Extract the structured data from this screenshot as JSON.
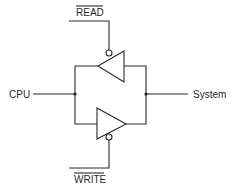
{
  "diagram": {
    "type": "bidirectional-buffer",
    "labels": {
      "read": "READ",
      "write": "WRITE",
      "cpu": "CPU",
      "system": "System"
    },
    "signals": {
      "read_active_low": true,
      "write_active_low": true
    },
    "buffers": [
      {
        "name": "read-buffer",
        "direction": "System to CPU",
        "enable": "READ"
      },
      {
        "name": "write-buffer",
        "direction": "CPU to System",
        "enable": "WRITE"
      }
    ],
    "colors": {
      "line": "#2a2a2a",
      "background": "#ffffff"
    }
  }
}
